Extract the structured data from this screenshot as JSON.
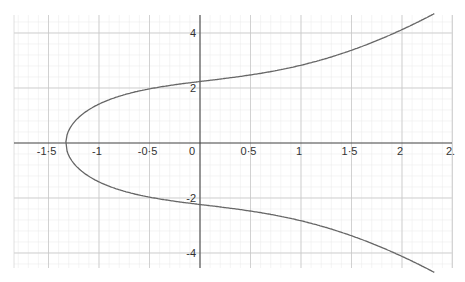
{
  "chart_data": {
    "type": "line",
    "title": "",
    "xlabel": "",
    "ylabel": "",
    "equation_estimate": "y^2 = x^3 + 2x + 5",
    "xlim": [
      -1.85,
      2.5
    ],
    "ylim": [
      -4.6,
      4.6
    ],
    "grid": true,
    "x_ticks": [
      {
        "value": -1.5,
        "label": "-1·5"
      },
      {
        "value": -1,
        "label": "-1"
      },
      {
        "value": -0.5,
        "label": "-0·5"
      },
      {
        "value": 0,
        "label": "0"
      },
      {
        "value": 0.5,
        "label": "0·5"
      },
      {
        "value": 1,
        "label": "1"
      },
      {
        "value": 1.5,
        "label": "1·5"
      },
      {
        "value": 2,
        "label": "2"
      },
      {
        "value": 2.5,
        "label": "2."
      }
    ],
    "y_ticks": [
      {
        "value": 4,
        "label": "4"
      },
      {
        "value": 2,
        "label": "2"
      },
      {
        "value": -2,
        "label": "-2"
      },
      {
        "value": -4,
        "label": "-4"
      }
    ],
    "series": [
      {
        "name": "curve",
        "color": "#666666",
        "x": [
          -1.32,
          -1.3,
          -1.2,
          -1.0,
          -0.5,
          0,
          0.5,
          1.0,
          1.5,
          2.0,
          2.3
        ],
        "y_upper": [
          0.0,
          0.38,
          1.0,
          1.41,
          1.97,
          2.24,
          2.47,
          2.83,
          3.37,
          4.12,
          4.67
        ],
        "y_lower": [
          0.0,
          -0.38,
          -1.0,
          -1.41,
          -1.97,
          -2.24,
          -2.47,
          -2.83,
          -3.37,
          -4.12,
          -4.67
        ]
      }
    ]
  }
}
